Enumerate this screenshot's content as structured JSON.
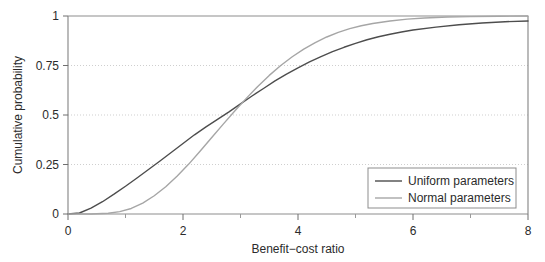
{
  "chart_data": {
    "type": "line",
    "title": "",
    "xlabel": "Benefit−cost ratio",
    "ylabel": "Cumulative probability",
    "xlim": [
      0,
      8
    ],
    "ylim": [
      0,
      1
    ],
    "xticks": [
      0,
      2,
      4,
      6,
      8
    ],
    "xticklabels": [
      "0",
      "2",
      "4",
      "6",
      "8"
    ],
    "xminorticks": [
      1,
      3,
      5,
      7
    ],
    "yticks": [
      0,
      0.25,
      0.5,
      0.75,
      1
    ],
    "yticklabels": [
      "0",
      "0.25",
      "0.5",
      "0.75",
      "1"
    ],
    "grid": "horizontal-dotted",
    "legend_position": "lower-right",
    "series": [
      {
        "name": "Uniform parameters",
        "color": "#4d4d4d",
        "x": [
          0.0,
          0.2,
          0.4,
          0.6,
          0.8,
          1.0,
          1.2,
          1.4,
          1.6,
          1.8,
          2.0,
          2.2,
          2.4,
          2.6,
          2.8,
          3.0,
          3.2,
          3.4,
          3.6,
          3.8,
          4.0,
          4.2,
          4.4,
          4.6,
          4.8,
          5.0,
          5.2,
          5.4,
          5.6,
          5.8,
          6.0,
          6.4,
          6.8,
          7.2,
          7.6,
          8.0
        ],
        "y": [
          0.0,
          0.005,
          0.03,
          0.062,
          0.1,
          0.14,
          0.182,
          0.225,
          0.268,
          0.312,
          0.356,
          0.4,
          0.44,
          0.478,
          0.516,
          0.556,
          0.596,
          0.634,
          0.672,
          0.706,
          0.738,
          0.768,
          0.795,
          0.82,
          0.842,
          0.862,
          0.88,
          0.895,
          0.908,
          0.919,
          0.929,
          0.944,
          0.956,
          0.965,
          0.971,
          0.975
        ]
      },
      {
        "name": "Normal parameters",
        "color": "#a6a6a6",
        "x": [
          0.0,
          0.4,
          0.7,
          0.9,
          1.1,
          1.3,
          1.5,
          1.7,
          1.9,
          2.1,
          2.3,
          2.5,
          2.7,
          2.9,
          3.1,
          3.3,
          3.5,
          3.7,
          3.9,
          4.1,
          4.3,
          4.5,
          4.7,
          4.9,
          5.1,
          5.3,
          5.6,
          5.9,
          6.2,
          6.6,
          7.0,
          7.5,
          8.0
        ],
        "y": [
          0.0,
          0.0,
          0.004,
          0.012,
          0.028,
          0.055,
          0.092,
          0.138,
          0.192,
          0.252,
          0.318,
          0.386,
          0.454,
          0.52,
          0.584,
          0.644,
          0.7,
          0.75,
          0.794,
          0.833,
          0.866,
          0.894,
          0.917,
          0.936,
          0.951,
          0.962,
          0.975,
          0.984,
          0.99,
          0.995,
          0.997,
          0.999,
          1.0
        ]
      }
    ],
    "legend": [
      {
        "label": "Uniform parameters",
        "color": "#4d4d4d"
      },
      {
        "label": "Normal parameters",
        "color": "#a6a6a6"
      }
    ]
  }
}
